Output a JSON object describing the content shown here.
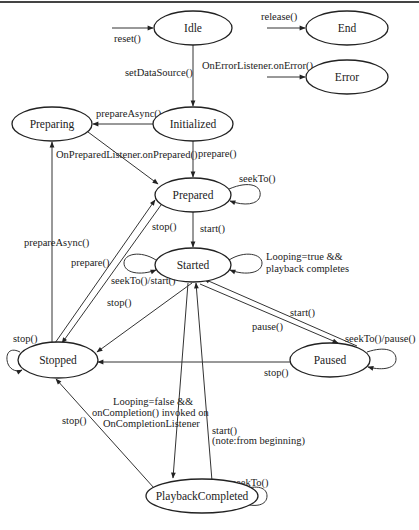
{
  "diagram": {
    "states": {
      "idle": "Idle",
      "end": "End",
      "error": "Error",
      "preparing": "Preparing",
      "initialized": "Initialized",
      "prepared": "Prepared",
      "started": "Started",
      "stopped": "Stopped",
      "paused": "Paused",
      "playback_completed": "PlaybackCompleted"
    },
    "transitions": {
      "reset": "reset()",
      "release": "release()",
      "on_error": "OnErrorListener.onError()",
      "set_data_source": "setDataSource()",
      "prepare_async_init": "prepareAsync()",
      "on_prepared": "OnPreparedListener.onPrepared()",
      "prepare_init": "prepare()",
      "seek_prepared": "seekTo()",
      "start_prepared": "start()",
      "prepare_async_stopped": "prepareAsync()",
      "stop_prepared": "stop()",
      "prepare_stopped": "prepare()",
      "looping_true_line1": "Looping=true &&",
      "looping_true_line2": "playback completes",
      "seek_start_started": "seekTo()/start()",
      "stop_started": "stop()",
      "stop_stopped_self": "stop()",
      "start_paused": "start()",
      "pause_started": "pause()",
      "seek_pause_paused": "seekTo()/pause()",
      "stop_paused": "stop()",
      "looping_false_line1": "Looping=false &&",
      "looping_false_line2": "onCompletion() invoked on",
      "looping_false_line3": "OnCompletionListener",
      "stop_completed": "stop()",
      "start_completed_line1": "start()",
      "start_completed_line2": "(note:from beginning)",
      "seek_completed": "seekTo()"
    },
    "colors": {
      "background": "#ffffff",
      "stroke": "#222222",
      "text": "#222222"
    }
  }
}
